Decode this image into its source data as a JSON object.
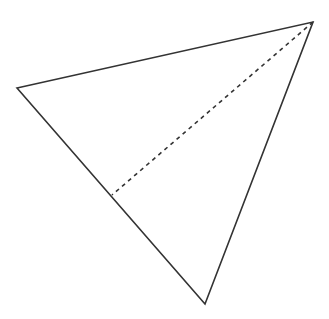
{
  "diagram": {
    "type": "triangle-with-dashed-segment",
    "canvas": {
      "width": 329,
      "height": 319,
      "background": "#ffffff"
    },
    "stroke_color": "#333333",
    "vertices": {
      "left": {
        "x": 17,
        "y": 88
      },
      "top_right": {
        "x": 313,
        "y": 22
      },
      "bottom": {
        "x": 205,
        "y": 304
      }
    },
    "dashed_segment": {
      "from": {
        "x": 313,
        "y": 22
      },
      "to": {
        "x": 112,
        "y": 195
      },
      "dash": "4 4"
    }
  }
}
